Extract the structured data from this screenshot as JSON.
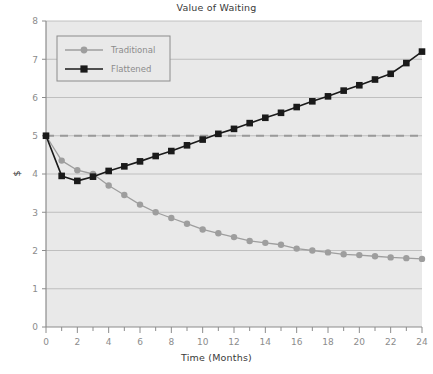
{
  "chart_data": {
    "type": "line",
    "title": "Value of Waiting",
    "xlabel": "Time (Months)",
    "ylabel": "$",
    "xlim": [
      0,
      24
    ],
    "ylim": [
      0,
      8
    ],
    "xticks": [
      0,
      2,
      4,
      6,
      8,
      10,
      12,
      14,
      16,
      18,
      20,
      22,
      24
    ],
    "xticklabels": [
      "0",
      "2",
      "4",
      "6",
      "8",
      "10",
      "12",
      "14",
      "16",
      "18",
      "20",
      "22",
      "24"
    ],
    "yticks": [
      0,
      1,
      2,
      3,
      4,
      5,
      6,
      7,
      8
    ],
    "yticklabels": [
      "0",
      "1",
      "2",
      "3",
      "4",
      "5",
      "6",
      "7",
      "8"
    ],
    "x_minor_tick_interval": 1,
    "grid": "horizontal",
    "grid_color": "#b4b4b4",
    "plot_background": "#e9e9e9",
    "legend_position": "upper left",
    "reference_line": {
      "name": "baseline-5",
      "value": 5,
      "style": "dashed",
      "color": "#9a9a9a"
    },
    "x": [
      0,
      1,
      2,
      3,
      4,
      5,
      6,
      7,
      8,
      9,
      10,
      11,
      12,
      13,
      14,
      15,
      16,
      17,
      18,
      19,
      20,
      21,
      22,
      23,
      24
    ],
    "series": [
      {
        "name": "Traditional",
        "color": "#9e9e9e",
        "marker": "circle",
        "values": [
          5.0,
          4.35,
          4.1,
          4.0,
          3.7,
          3.45,
          3.2,
          3.0,
          2.85,
          2.7,
          2.55,
          2.45,
          2.35,
          2.25,
          2.2,
          2.15,
          2.05,
          2.0,
          1.95,
          1.9,
          1.88,
          1.85,
          1.82,
          1.8,
          1.78
        ]
      },
      {
        "name": "Flattened",
        "color": "#1a1a1a",
        "marker": "square",
        "values": [
          5.0,
          3.95,
          3.82,
          3.93,
          4.08,
          4.2,
          4.33,
          4.47,
          4.6,
          4.75,
          4.9,
          5.05,
          5.18,
          5.33,
          5.47,
          5.6,
          5.75,
          5.9,
          6.03,
          6.18,
          6.32,
          6.47,
          6.62,
          6.9,
          7.2
        ]
      }
    ]
  },
  "legend": {
    "entries": [
      {
        "label": "Traditional"
      },
      {
        "label": "Flattened"
      }
    ]
  }
}
